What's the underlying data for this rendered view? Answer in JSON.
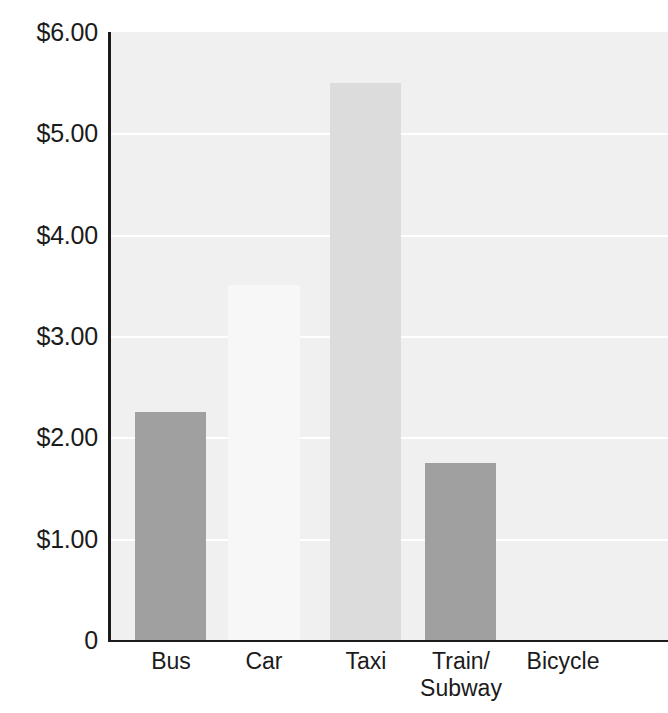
{
  "chart_data": {
    "type": "bar",
    "title": "",
    "subtitle": "",
    "xlabel": "",
    "ylabel": "",
    "categories": [
      "Bus",
      "Car",
      "Taxi",
      "Train/\nSubway",
      "Bicycle"
    ],
    "values": [
      2.25,
      3.5,
      5.5,
      1.75,
      0
    ],
    "value_labels": [
      "$2.25",
      "$3.50",
      "$5.50",
      "$1.75",
      "$0"
    ],
    "ylim": [
      0,
      6
    ],
    "y_major_step": 1,
    "y_minor_step": 0.25,
    "y_tick_labels": [
      "$6.00",
      "$5.00",
      "$4.00",
      "$3.00",
      "$2.00",
      "$1.00",
      "0"
    ],
    "y_tick_values": [
      6,
      5,
      4,
      3,
      2,
      1,
      0
    ],
    "grid": true,
    "grid_axis": "y",
    "legend": null,
    "legend_position": "none",
    "bar_colors": [
      "#a0a0a0",
      "#f7f7f7",
      "#dcdcdc",
      "#a0a0a0",
      "#f0f0f0"
    ],
    "series": [
      {
        "name": "Average cost per trip",
        "values": [
          2.25,
          3.5,
          5.5,
          1.75,
          0
        ]
      }
    ]
  },
  "style": {
    "plot_background": "#f0f0f0",
    "page_background": "#ffffff",
    "gridline_color": "#ffffff",
    "axis_color": "#1b1b1b",
    "tick_label_color": "#1b1b1b"
  }
}
